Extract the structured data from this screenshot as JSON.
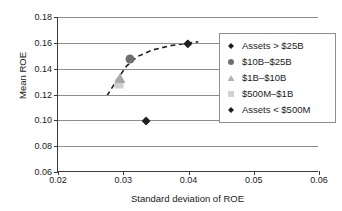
{
  "chart_data": {
    "type": "scatter",
    "title": "",
    "xlabel": "Standard deviation of ROE",
    "ylabel": "Mean ROE",
    "xlim": [
      0.02,
      0.06
    ],
    "ylim": [
      0.06,
      0.18
    ],
    "xticks": [
      "0.02",
      "0.03",
      "0.04",
      "0.05",
      "0.06"
    ],
    "xtick_values": [
      0.02,
      0.03,
      0.04,
      0.05,
      0.06
    ],
    "yticks": [
      "0.06",
      "0.08",
      "0.10",
      "0.12",
      "0.14",
      "0.16",
      "0.18"
    ],
    "ytick_values": [
      0.06,
      0.08,
      0.1,
      0.12,
      0.14,
      0.16,
      0.18
    ],
    "grid": "horizontal",
    "legend_position": "right",
    "points": [
      {
        "label": "Assets > $25B",
        "x": 0.0399,
        "y": 0.1592,
        "marker": "diamond",
        "color": "#202020"
      },
      {
        "label": "$10B–$25B",
        "x": 0.0311,
        "y": 0.1475,
        "marker": "circle",
        "color": "#6f6f6f"
      },
      {
        "label": "$1B–$10B",
        "x": 0.0295,
        "y": 0.1328,
        "marker": "triangle",
        "color": "#a8a8a8"
      },
      {
        "label": "$500M–$1B",
        "x": 0.0293,
        "y": 0.128,
        "marker": "square",
        "color": "#cfcfcf"
      },
      {
        "label": "Assets < $500M",
        "x": 0.0335,
        "y": 0.0995,
        "marker": "diamond",
        "color": "#202020"
      }
    ],
    "trend_curve": {
      "style": "dashed",
      "color": "#202020",
      "points": [
        {
          "x": 0.0275,
          "y": 0.119
        },
        {
          "x": 0.029,
          "y": 0.131
        },
        {
          "x": 0.0305,
          "y": 0.142
        },
        {
          "x": 0.0322,
          "y": 0.1495
        },
        {
          "x": 0.0345,
          "y": 0.1545
        },
        {
          "x": 0.0372,
          "y": 0.1578
        },
        {
          "x": 0.0399,
          "y": 0.1597
        },
        {
          "x": 0.0415,
          "y": 0.1608
        }
      ]
    },
    "legend": {
      "entries": [
        {
          "label": "Assets > $25B",
          "marker": "diamond"
        },
        {
          "label": "$10B–$25B",
          "marker": "circle"
        },
        {
          "label": "$1B–$10B",
          "marker": "triangle"
        },
        {
          "label": "$500M–$1B",
          "marker": "square"
        },
        {
          "label": "Assets < $500M",
          "marker": "diamond"
        }
      ]
    }
  }
}
